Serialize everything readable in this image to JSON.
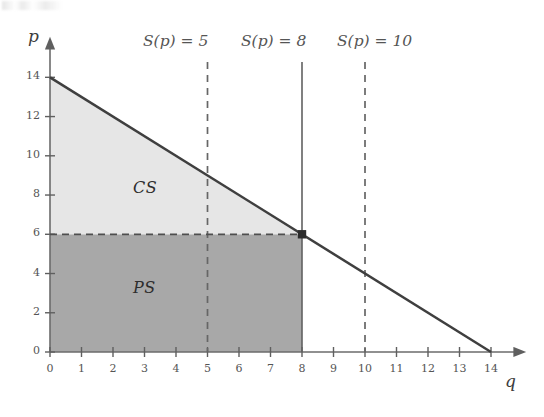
{
  "chart_data": {
    "type": "area",
    "title": "",
    "xlabel": "q",
    "ylabel": "p",
    "xlim": [
      0,
      14.9
    ],
    "ylim": [
      0,
      15.2
    ],
    "xticks": [
      0,
      1,
      2,
      3,
      4,
      5,
      6,
      7,
      8,
      9,
      10,
      11,
      12,
      13,
      14
    ],
    "yticks": [
      0,
      2,
      4,
      6,
      8,
      10,
      12,
      14
    ],
    "grid": false,
    "legend": "none",
    "series": [
      {
        "name": "demand-curve",
        "type": "line",
        "points": [
          [
            0,
            14
          ],
          [
            14,
            0
          ]
        ],
        "equation": "p = 14 - q",
        "color": "#404040"
      },
      {
        "name": "supply-vertical-q8",
        "type": "vline",
        "x": 8,
        "style": "solid",
        "color": "#555555"
      },
      {
        "name": "supply-vertical-q5",
        "type": "vline",
        "x": 5,
        "style": "dashed",
        "color": "#666666"
      },
      {
        "name": "supply-vertical-q10",
        "type": "vline",
        "x": 10,
        "style": "dashed",
        "color": "#666666"
      },
      {
        "name": "equilibrium-price-line",
        "type": "hline",
        "y": 6,
        "style": "dashed",
        "color": "#555555"
      }
    ],
    "points": [
      {
        "name": "equilibrium",
        "x": 8,
        "y": 6,
        "marker": "filled-square"
      }
    ],
    "regions": [
      {
        "name": "consumer-surplus",
        "label": "CS",
        "vertices": [
          [
            0,
            14
          ],
          [
            8,
            6
          ],
          [
            0,
            6
          ]
        ],
        "fill": "#e6e6e6",
        "value": 32
      },
      {
        "name": "producer-surplus",
        "label": "PS",
        "vertices": [
          [
            0,
            6
          ],
          [
            8,
            6
          ],
          [
            8,
            0
          ],
          [
            0,
            0
          ]
        ],
        "fill": "#a8a8a8",
        "value": 48
      }
    ],
    "annotations": [
      {
        "name": "supply-label-5",
        "text": "S(p) = 5",
        "x": 5,
        "y": 15.0
      },
      {
        "name": "supply-label-8",
        "text": "S(p) = 8",
        "x": 8,
        "y": 15.0
      },
      {
        "name": "supply-label-10",
        "text": "S(p) = 10",
        "x": 10,
        "y": 15.0
      }
    ]
  },
  "axes": {
    "y_label": "p",
    "x_label": "q",
    "x_tick_labels": [
      "0",
      "1",
      "2",
      "3",
      "4",
      "5",
      "6",
      "7",
      "8",
      "9",
      "10",
      "11",
      "12",
      "13",
      "14"
    ],
    "y_tick_labels": [
      "0",
      "2",
      "4",
      "6",
      "8",
      "10",
      "12",
      "14"
    ]
  },
  "annotations": {
    "supply_5": "S(p) = 5",
    "supply_8": "S(p) = 8",
    "supply_10": "S(p) = 10",
    "consumer_surplus": "CS",
    "producer_surplus": "PS"
  },
  "colors": {
    "consumer_surplus_fill": "#e6e6e6",
    "producer_surplus_fill": "#a8a8a8",
    "demand_line": "#404040",
    "axis": "#6b6b6b",
    "text": "#4a4a4a"
  }
}
